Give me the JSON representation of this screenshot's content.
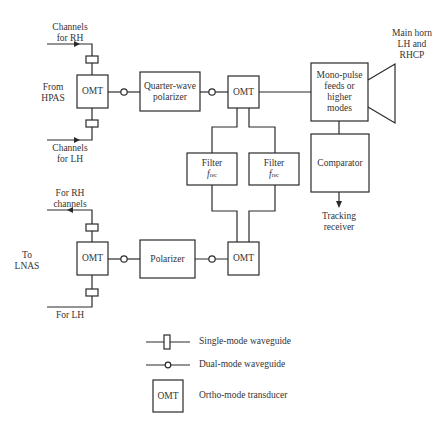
{
  "diagram": {
    "colors": {
      "line": "#2a2a2a",
      "background": "#ffffff"
    },
    "transmit_chain": {
      "input_rh": "Channels\nfor RH",
      "input_rh_lines": [
        "Channels",
        "for RH"
      ],
      "input_lh_lines": [
        "Channels",
        "for LH"
      ],
      "source_lines": [
        "From",
        "HPAS"
      ],
      "omt_left": "OMT",
      "quarter_wave_polarizer_lines": [
        "Quarter-wave",
        "polarizer"
      ],
      "omt_right": "OMT"
    },
    "tracking": {
      "monopulse_lines": [
        "Mono-pulse",
        "feeds or",
        "higher",
        "modes"
      ],
      "horn_lines": [
        "Main horn",
        "LH and",
        "RHCP"
      ],
      "comparator": "Comparator",
      "tracking_receiver_lines": [
        "Tracking",
        "receiver"
      ]
    },
    "filters": [
      {
        "label": "Filter",
        "freq_symbol": "f",
        "freq_sub": "rec"
      },
      {
        "label": "Filter",
        "freq_symbol": "f",
        "freq_sub": "rec"
      }
    ],
    "receive_chain": {
      "output_rh_lines": [
        "For RH",
        "channels"
      ],
      "output_lh": "For LH",
      "destination_lines": [
        "To",
        "LNAS"
      ],
      "omt_left": "OMT",
      "polarizer": "Polarizer",
      "omt_right": "OMT"
    },
    "legend": {
      "items": [
        {
          "symbol": "single-mode-waveguide",
          "label": "Single-mode waveguide"
        },
        {
          "symbol": "dual-mode-waveguide",
          "label": "Dual-mode waveguide"
        },
        {
          "symbol": "omt-box",
          "box_label": "OMT",
          "label": "Ortho-mode transducer"
        }
      ]
    }
  }
}
